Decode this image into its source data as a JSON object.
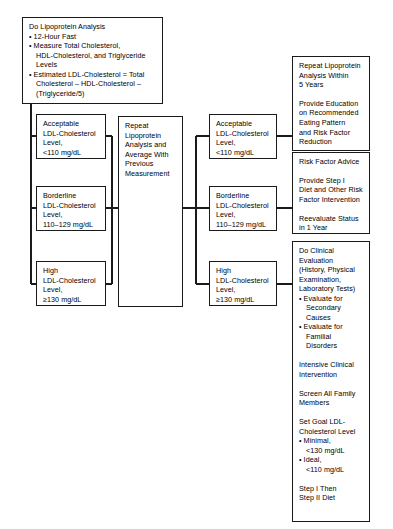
{
  "diagram": {
    "line_color": "#1a1a1a",
    "background": "#ffffff"
  },
  "boxes": {
    "intake": {
      "name": "Do Lipoprotein Analysis",
      "lines": [
        {
          "type": "head",
          "text": "Do Lipoprotein Analysis"
        },
        {
          "type": "bullet",
          "text": "• 12-Hour Fast"
        },
        {
          "type": "bullet",
          "text": "• Measure Total Cholesterol,"
        },
        {
          "type": "cont",
          "text": "HDL-Cholesterol, and Triglyceride"
        },
        {
          "type": "cont",
          "text": "Levels"
        },
        {
          "type": "bullet",
          "text": "• Estimated LDL-Cholesterol = Total"
        },
        {
          "type": "cont",
          "text": "Cholesterol – HDL-Cholesterol –"
        },
        {
          "type": "cont",
          "text": "(Triglyceride/5)"
        }
      ]
    },
    "left_acceptable": {
      "name": "Acceptable LDL-Cholesterol Level",
      "lines": [
        {
          "type": "plain",
          "text": "Acceptable"
        },
        {
          "type": "plain",
          "text": "LDL-Cholesterol"
        },
        {
          "type": "plain",
          "text": "Level,"
        },
        {
          "type": "plain",
          "text": "<110 mg/dL"
        }
      ]
    },
    "left_borderline": {
      "name": "Borderline LDL-Cholesterol Level",
      "lines": [
        {
          "type": "plain",
          "text": "Borderline"
        },
        {
          "type": "plain",
          "text": "LDL-Cholesterol"
        },
        {
          "type": "plain",
          "text": "Level,"
        },
        {
          "type": "plain",
          "text": "110–129 mg/dL"
        }
      ]
    },
    "left_high": {
      "name": "High LDL-Cholesterol Level",
      "lines": [
        {
          "type": "plain",
          "text": "High"
        },
        {
          "type": "plain",
          "text": "LDL-Cholesterol"
        },
        {
          "type": "plain",
          "text": "Level,"
        },
        {
          "type": "plain",
          "text": "≥130 mg/dL"
        }
      ]
    },
    "repeat_analysis": {
      "name": "Repeat Lipoprotein Analysis and Average With Previous Measurement",
      "lines": [
        {
          "type": "plain",
          "text": "Repeat"
        },
        {
          "type": "plain",
          "text": "Lipoprotein"
        },
        {
          "type": "plain",
          "text": "Analysis and"
        },
        {
          "type": "plain",
          "text": "Average With"
        },
        {
          "type": "plain",
          "text": "Previous"
        },
        {
          "type": "plain",
          "text": "Measurement"
        }
      ]
    },
    "mid_acceptable": {
      "name": "Acceptable LDL-Cholesterol Level",
      "lines": [
        {
          "type": "plain",
          "text": "Acceptable"
        },
        {
          "type": "plain",
          "text": "LDL-Cholesterol"
        },
        {
          "type": "plain",
          "text": "Level,"
        },
        {
          "type": "plain",
          "text": "<110 mg/dL"
        }
      ]
    },
    "mid_borderline": {
      "name": "Borderline LDL-Cholesterol Level",
      "lines": [
        {
          "type": "plain",
          "text": "Borderline"
        },
        {
          "type": "plain",
          "text": "LDL-Cholesterol"
        },
        {
          "type": "plain",
          "text": "Level,"
        },
        {
          "type": "plain",
          "text": "110–129 mg/dL"
        }
      ]
    },
    "mid_high": {
      "name": "High LDL-Cholesterol Level",
      "lines": [
        {
          "type": "plain",
          "text": "High"
        },
        {
          "type": "plain",
          "text": "LDL-Cholesterol"
        },
        {
          "type": "plain",
          "text": "Level,"
        },
        {
          "type": "plain",
          "text": "≥130 mg/dL"
        }
      ]
    },
    "outcome_repeat": {
      "name": "Repeat Lipoprotein Analysis Within 5 Years",
      "lines": [
        {
          "type": "plain",
          "text": "Repeat Lipoprotein"
        },
        {
          "type": "plain",
          "text": "Analysis Within"
        },
        {
          "type": "plain",
          "text": "5 Years"
        },
        {
          "type": "gap",
          "text": ""
        },
        {
          "type": "plain",
          "text": "Provide Education"
        },
        {
          "type": "plain",
          "text": "on Recommended"
        },
        {
          "type": "plain",
          "text": "Eating Pattern"
        },
        {
          "type": "plain",
          "text": "and Risk Factor"
        },
        {
          "type": "plain",
          "text": "Reduction"
        }
      ]
    },
    "outcome_risk": {
      "name": "Risk Factor Advice",
      "lines": [
        {
          "type": "plain",
          "text": "Risk Factor Advice"
        },
        {
          "type": "gap",
          "text": ""
        },
        {
          "type": "plain",
          "text": "Provide Step I"
        },
        {
          "type": "plain",
          "text": "Diet and Other Risk"
        },
        {
          "type": "plain",
          "text": "Factor Intervention"
        },
        {
          "type": "gap",
          "text": ""
        },
        {
          "type": "plain",
          "text": "Reevaluate Status"
        },
        {
          "type": "plain",
          "text": "in 1 Year"
        }
      ]
    },
    "outcome_clinical": {
      "name": "Do Clinical Evaluation",
      "lines": [
        {
          "type": "plain",
          "text": "Do Clinical"
        },
        {
          "type": "plain",
          "text": "Evaluation"
        },
        {
          "type": "plain",
          "text": "(History, Physical"
        },
        {
          "type": "plain",
          "text": "Examination,"
        },
        {
          "type": "plain",
          "text": "Laboratory Tests)"
        },
        {
          "type": "bullet",
          "text": "• Evaluate for"
        },
        {
          "type": "cont",
          "text": "Secondary"
        },
        {
          "type": "cont",
          "text": "Causes"
        },
        {
          "type": "bullet",
          "text": "• Evaluate for"
        },
        {
          "type": "cont",
          "text": "Familial"
        },
        {
          "type": "cont",
          "text": "Disorders"
        },
        {
          "type": "gap",
          "text": ""
        },
        {
          "type": "plain",
          "text": "Intensive Clinical"
        },
        {
          "type": "plain",
          "text": "Intervention"
        },
        {
          "type": "gap",
          "text": ""
        },
        {
          "type": "plain",
          "text": "Screen All Family"
        },
        {
          "type": "plain",
          "text": "Members"
        },
        {
          "type": "gap",
          "text": ""
        },
        {
          "type": "plain",
          "text": "Set Goal LDL-"
        },
        {
          "type": "plain",
          "text": "Cholesterol Level"
        },
        {
          "type": "bullet",
          "text": "• Minimal,"
        },
        {
          "type": "cont",
          "text": "<130 mg/dL"
        },
        {
          "type": "bullet",
          "text": "• Ideal,"
        },
        {
          "type": "cont",
          "text": "<110 mg/dL"
        },
        {
          "type": "gap",
          "text": ""
        },
        {
          "type": "plain",
          "text": "Step I Then"
        },
        {
          "type": "plain",
          "text": "Step II Diet"
        }
      ]
    }
  },
  "connectors": [
    {
      "name": "intake-down-stub",
      "x1": 31,
      "y1": 104,
      "x2": 31,
      "y2": 284
    },
    {
      "name": "intake-to-left-accept",
      "x1": 31,
      "y1": 136,
      "x2": 36,
      "y2": 136
    },
    {
      "name": "intake-to-left-border",
      "x1": 31,
      "y1": 208,
      "x2": 36,
      "y2": 208
    },
    {
      "name": "intake-to-left-high",
      "x1": 31,
      "y1": 284,
      "x2": 36,
      "y2": 284
    },
    {
      "name": "left-accept-to-trunk",
      "x1": 106,
      "y1": 136,
      "x2": 112,
      "y2": 136
    },
    {
      "name": "left-border-to-trunk",
      "x1": 106,
      "y1": 208,
      "x2": 112,
      "y2": 208
    },
    {
      "name": "left-high-to-trunk",
      "x1": 106,
      "y1": 284,
      "x2": 112,
      "y2": 284
    },
    {
      "name": "left-trunk-vertical",
      "x1": 112,
      "y1": 136,
      "x2": 112,
      "y2": 284
    },
    {
      "name": "trunk-into-repeat",
      "x1": 112,
      "y1": 208,
      "x2": 118,
      "y2": 208
    },
    {
      "name": "repeat-out",
      "x1": 183,
      "y1": 208,
      "x2": 196,
      "y2": 208
    },
    {
      "name": "right-trunk-vertical",
      "x1": 196,
      "y1": 136,
      "x2": 196,
      "y2": 284
    },
    {
      "name": "trunk-to-mid-accept",
      "x1": 196,
      "y1": 136,
      "x2": 209,
      "y2": 136
    },
    {
      "name": "trunk-to-mid-border",
      "x1": 196,
      "y1": 208,
      "x2": 209,
      "y2": 208
    },
    {
      "name": "trunk-to-mid-high",
      "x1": 196,
      "y1": 284,
      "x2": 209,
      "y2": 284
    },
    {
      "name": "mid-accept-to-outcome",
      "x1": 277,
      "y1": 136,
      "x2": 292,
      "y2": 136
    },
    {
      "name": "mid-border-to-outcome",
      "x1": 277,
      "y1": 208,
      "x2": 292,
      "y2": 208
    },
    {
      "name": "mid-high-to-outcome",
      "x1": 277,
      "y1": 284,
      "x2": 292,
      "y2": 284
    }
  ]
}
